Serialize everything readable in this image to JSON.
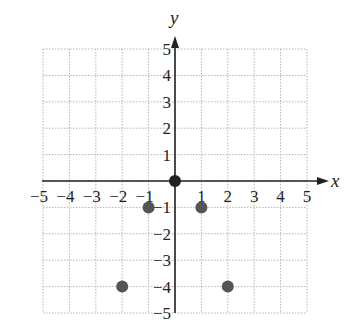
{
  "chart_data": {
    "type": "scatter",
    "title": "",
    "xlabel": "x",
    "ylabel": "y",
    "xlim": [
      -5,
      5
    ],
    "ylim": [
      -5,
      5
    ],
    "grid": true,
    "grid_style": "dotted",
    "x_ticks": [
      -5,
      -4,
      -3,
      -2,
      -1,
      1,
      2,
      3,
      4,
      5
    ],
    "y_ticks": [
      -5,
      -4,
      -3,
      -2,
      -1,
      1,
      2,
      3,
      4,
      5
    ],
    "x_tick_labels": [
      "−5",
      "−4",
      "−3",
      "−2",
      "−1",
      "1",
      "2",
      "3",
      "4",
      "5"
    ],
    "y_tick_labels": [
      "−5",
      "−4",
      "−3",
      "−2",
      "−1",
      "1",
      "2",
      "3",
      "4",
      "5"
    ],
    "series": [
      {
        "name": "points",
        "points": [
          {
            "x": 0,
            "y": 0
          },
          {
            "x": -1,
            "y": -1
          },
          {
            "x": 1,
            "y": -1
          },
          {
            "x": -2,
            "y": -4
          },
          {
            "x": 2,
            "y": -4
          }
        ],
        "color": "#555555"
      }
    ],
    "origin_point_color": "#222222",
    "axis_color": "#222222",
    "grid_color": "#b5b5b5"
  }
}
